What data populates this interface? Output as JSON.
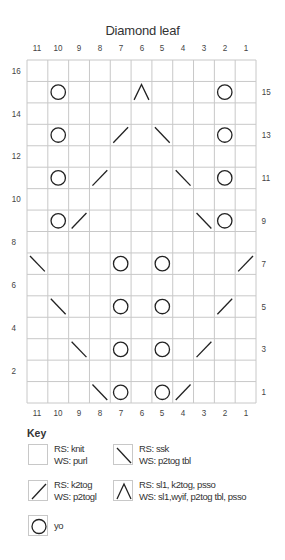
{
  "title": "Diamond leaf",
  "columns": [
    "11",
    "10",
    "9",
    "8",
    "7",
    "6",
    "5",
    "4",
    "3",
    "2",
    "1"
  ],
  "rows_left": [
    "16",
    "14",
    "12",
    "10",
    "8",
    "6",
    "4",
    "2"
  ],
  "rows_right": [
    "15",
    "13",
    "11",
    "9",
    "7",
    "5",
    "3",
    "1"
  ],
  "grid": {
    "cols": 11,
    "rows": 16,
    "line_color": "#c8c8c8",
    "symbol_color": "#222222"
  },
  "stitches": [
    {
      "row": 15,
      "col": 10,
      "symbol": "yo"
    },
    {
      "row": 15,
      "col": 6,
      "symbol": "sl1-k2tog-psso"
    },
    {
      "row": 15,
      "col": 2,
      "symbol": "yo"
    },
    {
      "row": 13,
      "col": 10,
      "symbol": "yo"
    },
    {
      "row": 13,
      "col": 7,
      "symbol": "k2tog"
    },
    {
      "row": 13,
      "col": 5,
      "symbol": "ssk"
    },
    {
      "row": 13,
      "col": 2,
      "symbol": "yo"
    },
    {
      "row": 11,
      "col": 10,
      "symbol": "yo"
    },
    {
      "row": 11,
      "col": 8,
      "symbol": "k2tog"
    },
    {
      "row": 11,
      "col": 4,
      "symbol": "ssk"
    },
    {
      "row": 11,
      "col": 2,
      "symbol": "yo"
    },
    {
      "row": 9,
      "col": 10,
      "symbol": "yo"
    },
    {
      "row": 9,
      "col": 9,
      "symbol": "k2tog"
    },
    {
      "row": 9,
      "col": 3,
      "symbol": "ssk"
    },
    {
      "row": 9,
      "col": 2,
      "symbol": "yo"
    },
    {
      "row": 7,
      "col": 11,
      "symbol": "ssk"
    },
    {
      "row": 7,
      "col": 7,
      "symbol": "yo"
    },
    {
      "row": 7,
      "col": 5,
      "symbol": "yo"
    },
    {
      "row": 7,
      "col": 1,
      "symbol": "k2tog"
    },
    {
      "row": 5,
      "col": 10,
      "symbol": "ssk"
    },
    {
      "row": 5,
      "col": 7,
      "symbol": "yo"
    },
    {
      "row": 5,
      "col": 5,
      "symbol": "yo"
    },
    {
      "row": 5,
      "col": 2,
      "symbol": "k2tog"
    },
    {
      "row": 3,
      "col": 9,
      "symbol": "ssk"
    },
    {
      "row": 3,
      "col": 7,
      "symbol": "yo"
    },
    {
      "row": 3,
      "col": 5,
      "symbol": "yo"
    },
    {
      "row": 3,
      "col": 3,
      "symbol": "k2tog"
    },
    {
      "row": 1,
      "col": 8,
      "symbol": "ssk"
    },
    {
      "row": 1,
      "col": 7,
      "symbol": "yo"
    },
    {
      "row": 1,
      "col": 5,
      "symbol": "yo"
    },
    {
      "row": 1,
      "col": 4,
      "symbol": "k2tog"
    }
  ],
  "key": {
    "title": "Key",
    "items": [
      {
        "symbol": "knit",
        "icon": "blank-square-icon",
        "line1": "RS: knit",
        "line2": "WS: purl"
      },
      {
        "symbol": "ssk",
        "icon": "backslash-icon",
        "line1": "RS: ssk",
        "line2": "WS: p2tog tbl"
      },
      {
        "symbol": "k2tog",
        "icon": "slash-icon",
        "line1": "RS: k2tog",
        "line2": "WS: p2togl"
      },
      {
        "symbol": "sl1-k2tog-psso",
        "icon": "caret-icon",
        "line1": "RS: sl1, k2tog, psso",
        "line2": "WS: sl1,wyif, p2tog tbl, psso"
      },
      {
        "symbol": "yo",
        "icon": "circle-icon",
        "line1": "yo",
        "line2": ""
      }
    ]
  }
}
